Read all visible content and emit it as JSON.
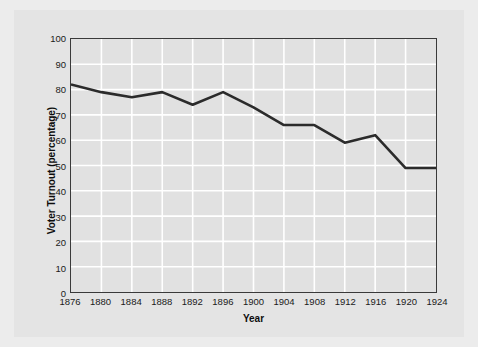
{
  "chart_data": {
    "type": "line",
    "title": "",
    "xlabel": "Year",
    "ylabel": "Voter Turnout (percentage)",
    "x": [
      1876,
      1880,
      1884,
      1888,
      1892,
      1896,
      1900,
      1904,
      1908,
      1912,
      1916,
      1920,
      1924
    ],
    "values": [
      82,
      79,
      77,
      79,
      74,
      79,
      73,
      66,
      66,
      59,
      62,
      49,
      49
    ],
    "series": [
      {
        "name": "Voter Turnout",
        "values": [
          82,
          79,
          77,
          79,
          74,
          79,
          73,
          66,
          66,
          59,
          62,
          49,
          49
        ]
      }
    ],
    "xlim": [
      1876,
      1924
    ],
    "ylim": [
      0,
      100
    ],
    "xticks": [
      "1876",
      "1880",
      "1884",
      "1888",
      "1892",
      "1896",
      "1900",
      "1904",
      "1908",
      "1912",
      "1916",
      "1920",
      "1924"
    ],
    "yticks": [
      "0",
      "10",
      "20",
      "30",
      "40",
      "50",
      "60",
      "70",
      "80",
      "90",
      "100"
    ],
    "grid": true,
    "legend": "none",
    "line_color": "#2b2b2b",
    "grid_color": "#ffffff",
    "plot_background": "#e1e1e1",
    "figure_background": "#e4e4e4"
  }
}
